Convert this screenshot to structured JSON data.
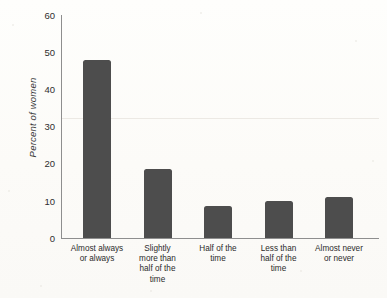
{
  "chart_data": {
    "type": "bar",
    "title": "",
    "xlabel": "",
    "ylabel": "Percent of women",
    "ylim": [
      0,
      60
    ],
    "yticks": [
      0,
      10,
      20,
      30,
      40,
      50,
      60
    ],
    "ytick_labels": [
      "0",
      "10",
      "20",
      "30",
      "40",
      "50",
      "60"
    ],
    "grid": false,
    "legend": null,
    "bar_color": "#4d4d4d",
    "categories": [
      "Almost always or always",
      "Slightly more than half of the time",
      "Half of the time",
      "Less than half of the time",
      "Almost never or never"
    ],
    "category_label_lines": [
      [
        "Almost always",
        "or always"
      ],
      [
        "Slightly",
        "more than",
        "half of the",
        "time"
      ],
      [
        "Half of the",
        "time"
      ],
      [
        "Less than",
        "half of the",
        "time"
      ],
      [
        "Almost never",
        "or never"
      ]
    ],
    "values": [
      48,
      18.5,
      8.5,
      10,
      11
    ]
  },
  "colors": {
    "bar": "#4d4d4d",
    "axis": "#8e8e8e",
    "text": "#2b2b2b",
    "background": "#fdfdfb"
  }
}
